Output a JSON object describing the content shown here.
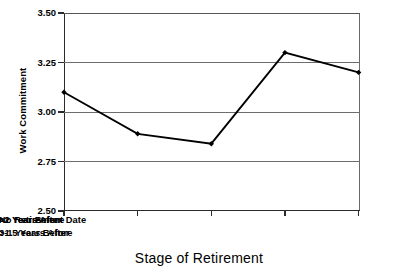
{
  "chart_data": {
    "type": "line",
    "title": "",
    "xlabel": "Stage of Retirement",
    "ylabel": "Work Commitment",
    "categories": [
      "No Retirement Date",
      "3-1 Years Before",
      "<1 Year Before",
      ">1.5 Years After",
      ">2 Years After"
    ],
    "values": [
      3.1,
      2.89,
      2.84,
      3.3,
      3.2
    ],
    "ylim": [
      2.5,
      3.5
    ],
    "yticks": [
      "2.50",
      "2.75",
      "3.00",
      "3.25",
      "3.50"
    ],
    "ytick_values": [
      2.5,
      2.75,
      3.0,
      3.25,
      3.5
    ],
    "grid": true,
    "legend": false,
    "marker": "filled-diamond",
    "line_color": "#000000",
    "grid_color": "#6d6d6d",
    "axis_color": "#2b2b2b",
    "background": "#ffffff"
  },
  "axes": {
    "y_title": "Work Commitment",
    "x_title": "Stage of Retirement"
  },
  "x_labels": {
    "row_top": [
      "No Retirement Date",
      "<1 Year Before",
      ">2 Years After"
    ],
    "row_bottom": [
      "3-1 Years Before",
      ">1.5 Years After"
    ]
  }
}
